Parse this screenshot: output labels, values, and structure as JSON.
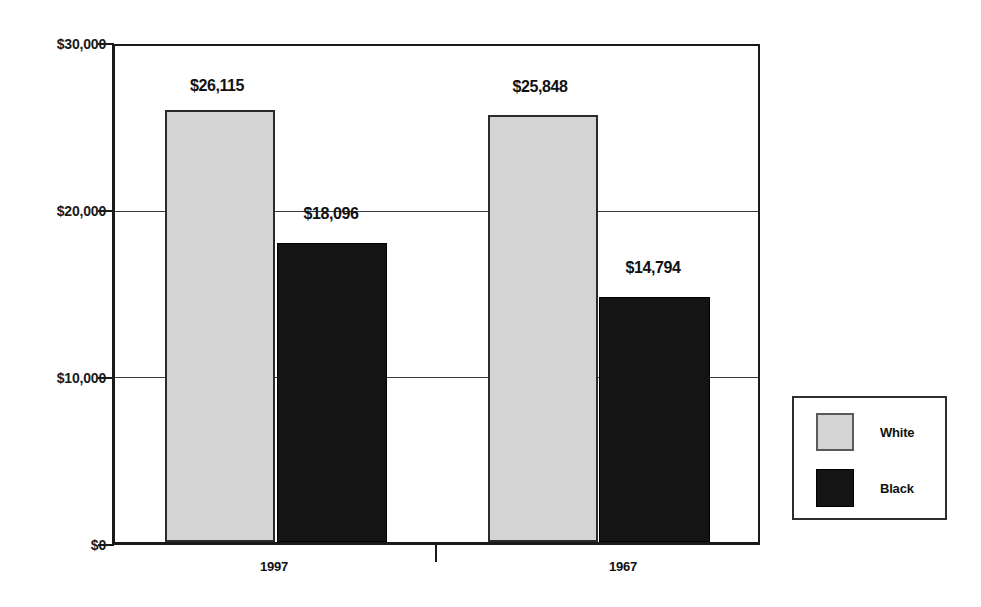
{
  "chart_data": {
    "type": "bar",
    "title": "",
    "subtitle": "",
    "xlabel": "",
    "ylabel": "",
    "categories": [
      "1997",
      "1967"
    ],
    "series": [
      {
        "name": "White",
        "color": "#d4d4d4",
        "values": [
          26115,
          25848
        ],
        "labels": [
          "$26,115",
          "$25,848"
        ]
      },
      {
        "name": "Black",
        "color": "#141414",
        "values": [
          18096,
          14794
        ],
        "labels": [
          "$18,096",
          "$14,794"
        ]
      }
    ],
    "ylim": [
      0,
      30000
    ],
    "yticks": [
      0,
      10000,
      20000,
      30000
    ],
    "ytick_labels": [
      "$0",
      "$10,000",
      "$20,000",
      "$30,000"
    ],
    "grid": true,
    "grid_axis": "y",
    "legend_position": "right-outside",
    "annotations": []
  },
  "legend": {
    "entries": [
      {
        "label": "White",
        "color": "#d4d4d4"
      },
      {
        "label": "Black",
        "color": "#141414"
      }
    ]
  },
  "colors": {
    "white_series": "#d4d4d4",
    "black_series": "#141414",
    "axis": "#1a1a1a",
    "gridline": "#3a3a3a",
    "background": "#ffffff"
  }
}
